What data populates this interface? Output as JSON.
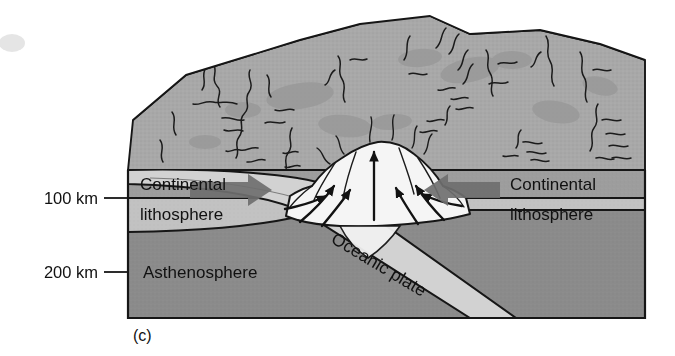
{
  "figure": {
    "panel_label": "(c)",
    "type": "geologic-block-diagram"
  },
  "depth_scale": {
    "ticks": [
      {
        "label": "100 km",
        "depth_km": 100
      },
      {
        "label": "200 km",
        "depth_km": 200
      }
    ]
  },
  "layers": {
    "continental_left": {
      "line1": "Continental",
      "line2": "lithosphere"
    },
    "continental_right": {
      "line1": "Continental",
      "line2": "lithosphere"
    },
    "asthenosphere": {
      "label": "Asthenosphere"
    },
    "oceanic": {
      "label": "Oceanic plate"
    }
  },
  "colors": {
    "background": "#ffffff",
    "outline": "#161616",
    "surface_terrain": "#a8a8a8",
    "surface_terrain_shade": "#9a9a9a",
    "crust_band": "#9d9d9d",
    "lithosphere_band": "#c2c2c2",
    "asthenosphere": "#8b8b8b",
    "oceanic_slab": "#cfcfcf",
    "volcano_fill": "#f4f4f4",
    "convergence_arrow": "#6f6f6f",
    "flow_arrow": "#121212"
  },
  "arrows": {
    "convergence_left": {
      "name": "left-convergence-arrow",
      "direction": "right"
    },
    "convergence_right": {
      "name": "right-convergence-arrow",
      "direction": "left"
    },
    "magma_flow": {
      "count": 7,
      "description": "curved arrows converging upward into volcano"
    },
    "vertical_uplift": {
      "description": "vertical arrow rising through volcano core"
    }
  }
}
